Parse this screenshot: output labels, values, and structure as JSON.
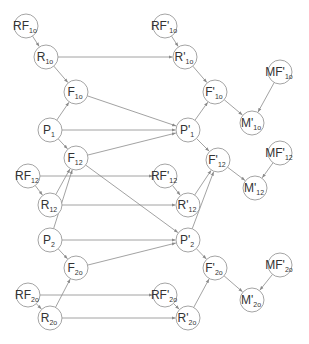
{
  "diagram": {
    "type": "directed-graph",
    "node_radius": 12,
    "colors": {
      "edge": "#8a8a8a",
      "node_stroke": "#9a9a9a",
      "text": "#333333"
    },
    "nodes": [
      {
        "id": "RF1o",
        "base": "RF",
        "prime": "",
        "sub": "1o",
        "x": 26,
        "y": 26
      },
      {
        "id": "R1o",
        "base": "R",
        "prime": "",
        "sub": "1o",
        "x": 46,
        "y": 57
      },
      {
        "id": "F1o",
        "base": "F",
        "prime": "",
        "sub": "1o",
        "x": 76,
        "y": 92
      },
      {
        "id": "P1",
        "base": "P",
        "prime": "",
        "sub": "1",
        "x": 50,
        "y": 130
      },
      {
        "id": "F12",
        "base": "F",
        "prime": "",
        "sub": "12",
        "x": 76,
        "y": 158
      },
      {
        "id": "RF12",
        "base": "RF",
        "prime": "",
        "sub": "12",
        "x": 28,
        "y": 176
      },
      {
        "id": "R12",
        "base": "R",
        "prime": "",
        "sub": "12",
        "x": 50,
        "y": 205
      },
      {
        "id": "P2",
        "base": "P",
        "prime": "",
        "sub": "2",
        "x": 50,
        "y": 240
      },
      {
        "id": "F2o",
        "base": "F",
        "prime": "",
        "sub": "2o",
        "x": 76,
        "y": 268
      },
      {
        "id": "RF2o",
        "base": "RF",
        "prime": "",
        "sub": "2o",
        "x": 28,
        "y": 295
      },
      {
        "id": "R2o",
        "base": "R",
        "prime": "",
        "sub": "2o",
        "x": 50,
        "y": 318
      },
      {
        "id": "RFp1o",
        "base": "RF",
        "prime": "'",
        "sub": "1o",
        "x": 165,
        "y": 26
      },
      {
        "id": "Rp1o",
        "base": "R",
        "prime": "'",
        "sub": "1o",
        "x": 185,
        "y": 57
      },
      {
        "id": "Fp1o",
        "base": "F",
        "prime": "'",
        "sub": "1o",
        "x": 215,
        "y": 92
      },
      {
        "id": "MFp1o",
        "base": "MF",
        "prime": "'",
        "sub": "1o",
        "x": 280,
        "y": 72
      },
      {
        "id": "Mp1o",
        "base": "M",
        "prime": "'",
        "sub": "1o",
        "x": 252,
        "y": 123
      },
      {
        "id": "Pp1",
        "base": "P",
        "prime": "'",
        "sub": "1",
        "x": 188,
        "y": 130
      },
      {
        "id": "Fp12",
        "base": "F",
        "prime": "'",
        "sub": "12",
        "x": 218,
        "y": 160
      },
      {
        "id": "MFp12",
        "base": "MF",
        "prime": "'",
        "sub": "12",
        "x": 280,
        "y": 153
      },
      {
        "id": "Mp12",
        "base": "M",
        "prime": "'",
        "sub": "12",
        "x": 255,
        "y": 188
      },
      {
        "id": "RFp12",
        "base": "RF",
        "prime": "'",
        "sub": "12",
        "x": 165,
        "y": 176
      },
      {
        "id": "Rp12",
        "base": "R",
        "prime": "'",
        "sub": "12",
        "x": 188,
        "y": 205
      },
      {
        "id": "Pp2",
        "base": "P",
        "prime": "'",
        "sub": "2",
        "x": 188,
        "y": 240
      },
      {
        "id": "Fp2o",
        "base": "F",
        "prime": "'",
        "sub": "2o",
        "x": 215,
        "y": 268
      },
      {
        "id": "MFp2o",
        "base": "MF",
        "prime": "'",
        "sub": "2o",
        "x": 280,
        "y": 265
      },
      {
        "id": "Mp2o",
        "base": "M",
        "prime": "'",
        "sub": "2o",
        "x": 252,
        "y": 300
      },
      {
        "id": "RFp2o",
        "base": "RF",
        "prime": "'",
        "sub": "2o",
        "x": 165,
        "y": 295
      },
      {
        "id": "Rp2o",
        "base": "R",
        "prime": "'",
        "sub": "2o",
        "x": 188,
        "y": 318
      }
    ],
    "edges": [
      [
        "RF1o",
        "R1o"
      ],
      [
        "R1o",
        "F1o"
      ],
      [
        "R1o",
        "Rp1o"
      ],
      [
        "P1",
        "F1o"
      ],
      [
        "F1o",
        "Pp1"
      ],
      [
        "P1",
        "Pp1"
      ],
      [
        "P1",
        "F12"
      ],
      [
        "F12",
        "Pp1"
      ],
      [
        "F12",
        "Pp2"
      ],
      [
        "RF12",
        "R12"
      ],
      [
        "RF12",
        "RFp12"
      ],
      [
        "R12",
        "F12"
      ],
      [
        "R12",
        "Rp12"
      ],
      [
        "P2",
        "F12"
      ],
      [
        "P2",
        "Pp2"
      ],
      [
        "P2",
        "F2o"
      ],
      [
        "F2o",
        "Pp2"
      ],
      [
        "RF2o",
        "R2o"
      ],
      [
        "RF2o",
        "RFp2o"
      ],
      [
        "R2o",
        "F2o"
      ],
      [
        "R2o",
        "Rp2o"
      ],
      [
        "RFp1o",
        "Rp1o"
      ],
      [
        "Rp1o",
        "Fp1o"
      ],
      [
        "Pp1",
        "Fp1o"
      ],
      [
        "Fp1o",
        "Mp1o"
      ],
      [
        "MFp1o",
        "Mp1o"
      ],
      [
        "Pp1",
        "Fp12"
      ],
      [
        "Rp12",
        "Fp12"
      ],
      [
        "Pp2",
        "Fp12"
      ],
      [
        "Fp12",
        "Mp12"
      ],
      [
        "MFp12",
        "Mp12"
      ],
      [
        "RFp12",
        "Rp12"
      ],
      [
        "Pp2",
        "Fp2o"
      ],
      [
        "Rp2o",
        "Fp2o"
      ],
      [
        "Fp2o",
        "Mp2o"
      ],
      [
        "MFp2o",
        "Mp2o"
      ],
      [
        "RFp2o",
        "Rp2o"
      ]
    ]
  }
}
